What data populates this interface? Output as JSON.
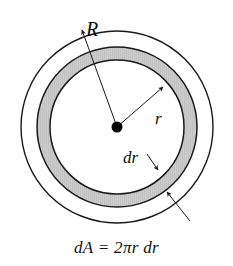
{
  "figure": {
    "name": "annulus-area-element-diagram",
    "caption_formula": "dA = 2πr dr",
    "background_color": "#ffffff",
    "stroke_color": "#1a1a1a",
    "shaded_fill_color": "#c9c9c9",
    "center_dot_color": "#000000",
    "geometry": {
      "center_x": 117,
      "center_y": 127,
      "outer_circle_radius": 96,
      "annulus_outer_radius": 80,
      "annulus_inner_radius": 67
    },
    "labels": {
      "outer_radius": "R",
      "inner_radius": "r",
      "thickness": "dr"
    },
    "annotations": {
      "R_description": "arrow from center toward outer circle edge",
      "r_description": "arrow from center dot to inner edge of shaded ring",
      "dr_description": "leader arrows marking the thickness of the shaded ring"
    }
  }
}
